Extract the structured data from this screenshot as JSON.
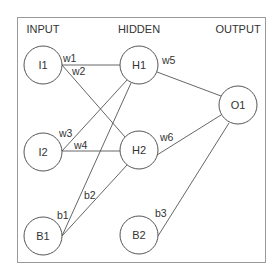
{
  "diagram": {
    "type": "neural-network",
    "layers": {
      "input": "INPUT",
      "hidden": "HIDDEN",
      "output": "OUTPUT"
    },
    "nodes": {
      "I1": {
        "label": "I1",
        "x": 43,
        "y": 65
      },
      "I2": {
        "label": "I2",
        "x": 43,
        "y": 152
      },
      "B1": {
        "label": "B1",
        "x": 43,
        "y": 236
      },
      "H1": {
        "label": "H1",
        "x": 139,
        "y": 65
      },
      "H2": {
        "label": "H2",
        "x": 139,
        "y": 150
      },
      "B2": {
        "label": "B2",
        "x": 139,
        "y": 235
      },
      "O1": {
        "label": "O1",
        "x": 238,
        "y": 105
      }
    },
    "edges": [
      {
        "from": "I1",
        "to": "H1",
        "label": "w1"
      },
      {
        "from": "I1",
        "to": "H2",
        "label": "w2"
      },
      {
        "from": "I2",
        "to": "H1",
        "label": "w3"
      },
      {
        "from": "I2",
        "to": "H2",
        "label": "w4"
      },
      {
        "from": "H1",
        "to": "O1",
        "label": "w5"
      },
      {
        "from": "H2",
        "to": "O1",
        "label": "w6"
      },
      {
        "from": "B1",
        "to": "H1",
        "label": "b1"
      },
      {
        "from": "B1",
        "to": "H2",
        "label": "b2"
      },
      {
        "from": "B2",
        "to": "O1",
        "label": "b3"
      }
    ]
  }
}
